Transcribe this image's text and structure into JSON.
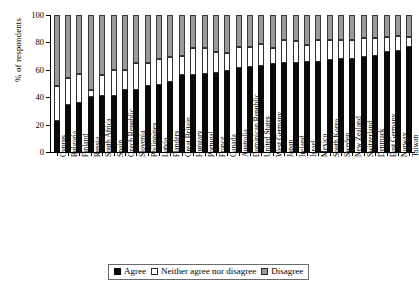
{
  "chart_data": {
    "type": "bar",
    "subtype": "stacked-bar-100",
    "title": "",
    "xlabel": "",
    "ylabel": "% of respondents",
    "ylim": [
      0,
      100
    ],
    "yticks": [
      0,
      20,
      40,
      60,
      80,
      100
    ],
    "grid": false,
    "legend_position": "bottom",
    "categories": [
      "Cyprus",
      "Bulgaria",
      "Finland",
      "Russia",
      "South Africa",
      "Spain",
      "Czech Republic",
      "Slovenia",
      "Philippines",
      "Latvia",
      "Flanders",
      "Great Britain",
      "Hungary",
      "Portugal",
      "France",
      "Canada",
      "Australia",
      "Dominican Republic",
      "United States",
      "West Germany",
      "Japan",
      "Ireland",
      "Israel",
      "Mexico",
      "South Korea",
      "Sweden",
      "New Zealand",
      "Switzerland",
      "Denmark",
      "East Germany",
      "Norway",
      "Taiwan"
    ],
    "series": [
      {
        "name": "Agree",
        "color": "#0a0a0a",
        "values": [
          23,
          34,
          36,
          40,
          41,
          41,
          45,
          45,
          48,
          49,
          51,
          56,
          56,
          57,
          58,
          59,
          61,
          62,
          63,
          64,
          65,
          65,
          66,
          66,
          67,
          68,
          68,
          69,
          70,
          73,
          74,
          77
        ]
      },
      {
        "name": "Neither agree nor disagree",
        "color": "#ffffff",
        "values": [
          25,
          20,
          21,
          5,
          15,
          19,
          15,
          20,
          17,
          19,
          18,
          14,
          20,
          19,
          15,
          13,
          16,
          15,
          16,
          12,
          17,
          16,
          12,
          16,
          15,
          14,
          14,
          14,
          13,
          11,
          11,
          7
        ]
      },
      {
        "name": "Disagree",
        "color": "#9a9a9a",
        "values": [
          52,
          46,
          43,
          55,
          44,
          40,
          40,
          35,
          35,
          32,
          31,
          30,
          24,
          24,
          27,
          28,
          23,
          23,
          21,
          24,
          18,
          19,
          22,
          18,
          18,
          18,
          18,
          17,
          17,
          16,
          15,
          16
        ]
      }
    ],
    "legend": [
      {
        "label": "Agree",
        "swatch": "black-square-swatch"
      },
      {
        "label": "Neither agree nor disagree",
        "swatch": "white-square-swatch"
      },
      {
        "label": "Disagree",
        "swatch": "gray-square-swatch"
      }
    ]
  }
}
